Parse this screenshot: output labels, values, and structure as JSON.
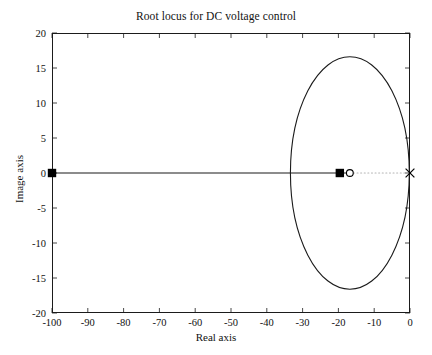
{
  "chart_data": {
    "type": "line",
    "title": "Root locus for DC voltage control",
    "xlabel": "Real axis",
    "ylabel": "Image axis",
    "xlim": [
      -100,
      0
    ],
    "ylim": [
      -20,
      20
    ],
    "xticks": [
      -100,
      -90,
      -80,
      -70,
      -60,
      -50,
      -40,
      -30,
      -20,
      -10,
      0
    ],
    "xtick_labels": [
      "-100",
      "-90",
      "-80",
      "-70",
      "-60",
      "-50",
      "-40",
      "-30",
      "-20",
      "-10",
      "0"
    ],
    "yticks": [
      -20,
      -15,
      -10,
      -5,
      0,
      5,
      10,
      15,
      20
    ],
    "ytick_labels": [
      "-20",
      "-15",
      "-10",
      "-5",
      "0",
      "5",
      "10",
      "15",
      "20"
    ],
    "grid": false,
    "legend": null,
    "line_color": "#1b1b1b",
    "marker_color": "#000000",
    "dotted_color": "#b4b4b4",
    "series": [
      {
        "name": "locus-real-branch",
        "style": "solid",
        "x": [
          -100,
          -16.8
        ],
        "y": [
          0,
          0
        ]
      },
      {
        "name": "locus-ellipse-branch",
        "style": "solid",
        "center_x": -16.8,
        "center_y": 0,
        "semi_axis_x": 16.6,
        "semi_axis_y": 16.6,
        "x_left": -33.4,
        "x_right": -0.2,
        "y_top": 16.6,
        "y_bottom": -16.6
      },
      {
        "name": "asymptote-dotted",
        "style": "dotted",
        "x": [
          -16.8,
          0
        ],
        "y": [
          0,
          0
        ]
      }
    ],
    "markers": [
      {
        "name": "closed-loop-pole-left",
        "symbol": "filled-square",
        "x": -100,
        "y": 0
      },
      {
        "name": "closed-loop-pole-right",
        "symbol": "filled-square",
        "x": -19.6,
        "y": 0
      },
      {
        "name": "open-loop-zero",
        "symbol": "open-circle",
        "x": -16.8,
        "y": 0
      },
      {
        "name": "open-loop-pole-origin",
        "symbol": "cross-x",
        "x": 0,
        "y": 0
      }
    ]
  }
}
